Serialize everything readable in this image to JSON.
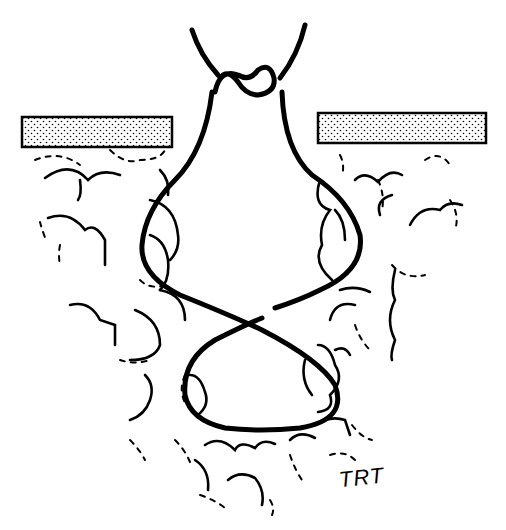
{
  "figure": {
    "signature": "TRT",
    "colors": {
      "ink": "#000000",
      "background": "#ffffff",
      "skin_fill": "#ffffff"
    },
    "elements": [
      "skin-surface-left",
      "skin-surface-right",
      "suture-knot",
      "suture-upper-loop",
      "suture-crossing",
      "suture-lower-loop",
      "subcutaneous-fat-lobules"
    ]
  }
}
